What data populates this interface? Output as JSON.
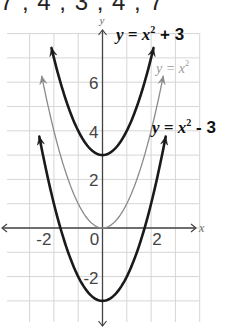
{
  "header": {
    "sequence_text": "7 , 4 , 3 , 4 , 7"
  },
  "chart_data": {
    "type": "line",
    "title": "",
    "xlabel": "x",
    "ylabel": "y",
    "xlim": [
      -4,
      4
    ],
    "ylim": [
      -4,
      8
    ],
    "grid": true,
    "x_ticks": [
      {
        "value": -2,
        "label": "-2"
      },
      {
        "value": 0,
        "label": "0"
      },
      {
        "value": 2,
        "label": "2"
      }
    ],
    "y_ticks": [
      {
        "value": 6,
        "label": "6"
      },
      {
        "value": 4,
        "label": "4"
      },
      {
        "value": 2,
        "label": "2"
      },
      {
        "value": -2,
        "label": "-2"
      }
    ],
    "series": [
      {
        "name": "y = x² + 3",
        "label_base": "y = x",
        "label_sup": "2",
        "label_tail": " + 3",
        "shift": 3,
        "color": "#1a1a1a",
        "width": 2.6,
        "x_range": [
          -2.1,
          2.1
        ],
        "style": "bold"
      },
      {
        "name": "y = x²",
        "label_base": "y = x",
        "label_sup": "2",
        "label_tail": "",
        "shift": 0,
        "color": "#8a8a8a",
        "width": 1.3,
        "x_range": [
          -2.5,
          2.5
        ],
        "style": "light"
      },
      {
        "name": "y = x² - 3",
        "label_base": "y = x",
        "label_sup": "2",
        "label_tail": " - 3",
        "shift": -3,
        "color": "#1a1a1a",
        "width": 2.6,
        "x_range": [
          -2.6,
          2.6
        ],
        "style": "bold"
      }
    ]
  }
}
